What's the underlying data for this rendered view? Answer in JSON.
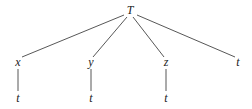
{
  "tree": {
    "nodes": [
      {
        "id": "root",
        "label": "T",
        "x": 130,
        "y": 14
      },
      {
        "id": "x",
        "label": "x",
        "x": 18,
        "y": 65
      },
      {
        "id": "y",
        "label": "y",
        "x": 91,
        "y": 65
      },
      {
        "id": "z",
        "label": "z",
        "x": 166,
        "y": 65
      },
      {
        "id": "t4",
        "label": "t",
        "x": 238,
        "y": 65
      },
      {
        "id": "tx",
        "label": "t",
        "x": 18,
        "y": 101
      },
      {
        "id": "ty",
        "label": "t",
        "x": 91,
        "y": 101
      },
      {
        "id": "tz",
        "label": "t",
        "x": 166,
        "y": 101
      }
    ],
    "edges": [
      {
        "from": "root",
        "to": "x"
      },
      {
        "from": "root",
        "to": "y"
      },
      {
        "from": "root",
        "to": "z"
      },
      {
        "from": "root",
        "to": "t4"
      },
      {
        "from": "x",
        "to": "tx"
      },
      {
        "from": "y",
        "to": "ty"
      },
      {
        "from": "z",
        "to": "tz"
      }
    ]
  }
}
